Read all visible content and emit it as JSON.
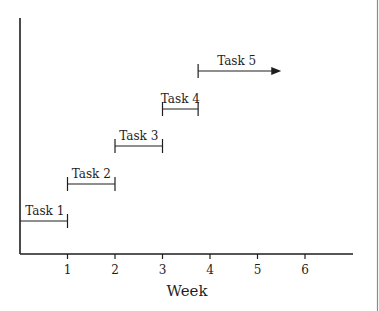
{
  "chart_data": {
    "type": "gantt",
    "title": "",
    "xlabel": "Week",
    "ylabel": "",
    "xlim": [
      0,
      7
    ],
    "xticks": [
      1,
      2,
      3,
      4,
      5,
      6
    ],
    "grid": false,
    "legend": null,
    "tasks": [
      {
        "label": "Task 1",
        "start": 0,
        "end": 1,
        "open_ended": false
      },
      {
        "label": "Task 2",
        "start": 1,
        "end": 2,
        "open_ended": false
      },
      {
        "label": "Task 3",
        "start": 2,
        "end": 3,
        "open_ended": false
      },
      {
        "label": "Task 4",
        "start": 3,
        "end": 3.75,
        "open_ended": false
      },
      {
        "label": "Task 5",
        "start": 3.75,
        "end": 5.5,
        "open_ended": true
      }
    ]
  },
  "colors": {
    "ink": "#1e1e1e",
    "border": "#8a8a8a"
  }
}
